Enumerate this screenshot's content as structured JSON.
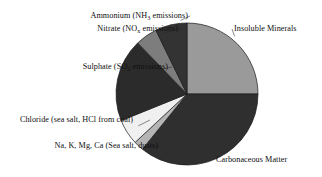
{
  "chart_data": {
    "type": "pie",
    "title": "",
    "legend_position": "callout-labels",
    "grid": false,
    "units": "percent of total particulate mass",
    "start_angle_deg": 0,
    "direction": "clockwise",
    "categories": [
      "Insoluble Minerals",
      "Carbonaceous Matter",
      "Na, K, Mg, Ca (Sea salt, dusts)",
      "Chloride (sea salt, HCl from coal)",
      "Sulphate (SO2 emissions)",
      "Nitrate (NOx emissions)",
      "Ammonium (NH3 emissions)"
    ],
    "values": [
      25,
      36,
      2,
      6,
      19,
      5,
      7
    ],
    "colors": [
      "#9a9a9a",
      "#2f2f2f",
      "#b5b5b5",
      "#f0f0f0",
      "#2b2b2b",
      "#7d7d7d",
      "#333333"
    ],
    "slices": [
      {
        "name": "insoluble-minerals",
        "label": "Insoluble Minerals",
        "value": 25,
        "color": "#9a9a9a",
        "start_deg": 0,
        "end_deg": 90
      },
      {
        "name": "carbonaceous-matter",
        "label": "Carbonaceous Matter",
        "value": 36,
        "color": "#2f2f2f",
        "start_deg": 90,
        "end_deg": 219
      },
      {
        "name": "sea-salt-cations",
        "label": "Na, K, Mg, Ca (Sea salt, dusts)",
        "value": 2,
        "color": "#b5b5b5",
        "start_deg": 219,
        "end_deg": 227
      },
      {
        "name": "chloride",
        "label": "Chloride (sea salt, HCl from coal)",
        "value": 6,
        "color": "#f0f0f0",
        "start_deg": 227,
        "end_deg": 248
      },
      {
        "name": "sulphate",
        "label": "Sulphate (SO2 emissions)",
        "value": 19,
        "color": "#2b2b2b",
        "start_deg": 248,
        "end_deg": 316
      },
      {
        "name": "nitrate",
        "label": "Nitrate (NOx emissions)",
        "value": 5,
        "color": "#7d7d7d",
        "start_deg": 316,
        "end_deg": 334
      },
      {
        "name": "ammonium",
        "label": "Ammonium (NH3 emissions)",
        "value": 7,
        "color": "#333333",
        "start_deg": 334,
        "end_deg": 360
      }
    ]
  },
  "labels": {
    "ammonium": {
      "pre": "Ammonium (NH",
      "sub": "3",
      "post": " emissions)"
    },
    "nitrate": {
      "pre": "Nitrate (NO",
      "sub": "x",
      "post": " emissions)"
    },
    "sulphate": {
      "pre": "Sulphate (SO",
      "sub": "2",
      "post": " emissions)"
    },
    "chloride": {
      "text": "Chloride (sea salt, HCl from coal)"
    },
    "sea_salt_cations": {
      "text": "Na, K, Mg, Ca (Sea salt, dusts)"
    },
    "insoluble_minerals": {
      "text": "Insoluble Minerals"
    },
    "carbonaceous_matter": {
      "text": "Carbonaceous Matter"
    }
  },
  "geometry": {
    "center_x": 187,
    "center_y": 94,
    "radius": 71
  }
}
